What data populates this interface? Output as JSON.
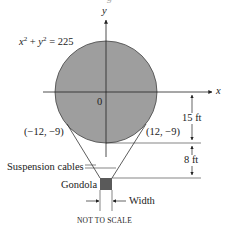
{
  "title_partial": "g",
  "axes": {
    "x_label": "x",
    "y_label": "y",
    "origin_label": "0"
  },
  "equation": {
    "lhs_x": "x",
    "exp1": "2",
    "plus": " + ",
    "lhs_y": "y",
    "exp2": "2",
    "rhs": " = 225"
  },
  "points": {
    "left": "(−12, −9)",
    "right": "(12, −9)"
  },
  "dimensions": {
    "upper": "15 ft",
    "lower": "8 ft",
    "width": "Width"
  },
  "labels": {
    "cables": "Suspension cables",
    "gondola": "Gondola",
    "note": "NOT TO SCALE"
  },
  "colors": {
    "balloon_fill": "#9e9e9e",
    "gondola_fill": "#5a5a5a",
    "line": "#333333"
  }
}
